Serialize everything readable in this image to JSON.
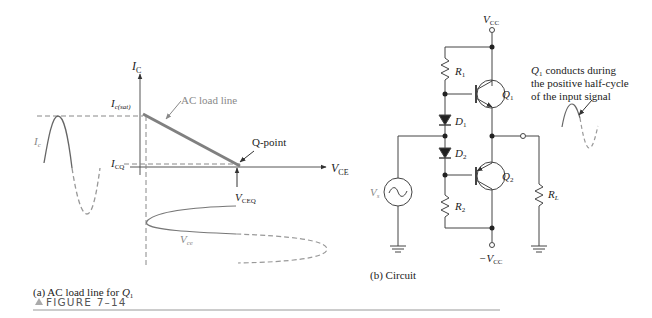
{
  "figure": {
    "number_label": "FIGURE 7–14",
    "marker_icon": "triangle-up-icon"
  },
  "panel_a": {
    "caption_prefix": "(a) AC load line for ",
    "caption_var": "Q",
    "caption_sub": "1",
    "y_axis": {
      "main": "I",
      "sub": "C"
    },
    "x_axis": {
      "main": "V",
      "sub": "CE"
    },
    "ic_sat": {
      "main": "I",
      "sub": "c(sat)"
    },
    "icq": {
      "main": "I",
      "sub": "CQ"
    },
    "vceq": {
      "main": "V",
      "sub": "CEQ"
    },
    "ic_wave": {
      "main": "I",
      "sub": "c"
    },
    "vce_wave": {
      "main": "V",
      "sub": "ce"
    },
    "load_line_label": "AC load line",
    "q_point_label": "Q-point",
    "colors": {
      "load_line": "#808080",
      "axes": "#555555",
      "waveform": "#666666",
      "dashed": "#999999"
    }
  },
  "panel_b": {
    "caption": "(b) Circuit",
    "vcc": {
      "main": "V",
      "sub": "CC"
    },
    "neg_vcc": {
      "main": "−V",
      "sub": "CC"
    },
    "r1": {
      "main": "R",
      "sub": "1"
    },
    "r2": {
      "main": "R",
      "sub": "2"
    },
    "rl": {
      "main": "R",
      "sub": "L"
    },
    "d1": {
      "main": "D",
      "sub": "1"
    },
    "d2": {
      "main": "D",
      "sub": "2"
    },
    "q1": {
      "main": "Q",
      "sub": "1"
    },
    "q2": {
      "main": "Q",
      "sub": "2"
    },
    "vs": {
      "main": "V",
      "sub": "s"
    },
    "note_lines": [
      "conducts during",
      "the positive half-cycle",
      "of the input signal"
    ],
    "note_q": {
      "main": "Q",
      "sub": "1"
    }
  }
}
